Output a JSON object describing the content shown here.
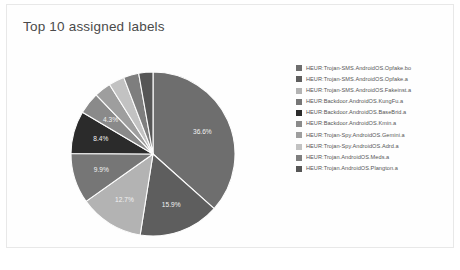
{
  "chart_title": "Top 10 assigned labels",
  "caption": "",
  "chart_data": {
    "type": "pie",
    "title": "Top 10 assigned labels",
    "legend_position": "right",
    "start_angle_deg": 0,
    "direction": "clockwise",
    "categories": [
      "HEUR:Trojan-SMS.AndroidOS.Opfake.bo",
      "HEUR:Trojan-SMS.AndroidOS.Opfake.a",
      "HEUR:Trojan-SMS.AndroidOS.Fakeinst.a",
      "HEUR:Backdoor.AndroidOS.KungFu.a",
      "HEUR:Backdoor.AndroidOS.BaseBrid.a",
      "HEUR:Backdoor.AndroidOS.Kmin.a",
      "HEUR:Trojan-Spy.AndroidOS.Gemini.a",
      "HEUR:Trojan-Spy.AndroidOS.Adrd.a",
      "HEUR:Trojan.AndroidOS.Meds.a",
      "HEUR:Trojan.AndroidOS.Plangton.a"
    ],
    "values": [
      36.6,
      15.9,
      12.7,
      9.9,
      8.4,
      4.3,
      3.3,
      3.1,
      3.0,
      2.8
    ],
    "value_labels": [
      "36.6%",
      "15.9%",
      "12.7%",
      "9.9%",
      "8.4%",
      "4.3%",
      "",
      "",
      "",
      ""
    ],
    "colors": [
      "#6e6e6e",
      "#5e5e5e",
      "#b3b3b3",
      "#767676",
      "#2b2b2b",
      "#8a8a8a",
      "#9e9e9e",
      "#c2c2c2",
      "#7e7e7e",
      "#565656"
    ],
    "units": "percent"
  },
  "legend": {
    "items": [
      {
        "label": "HEUR:Trojan-SMS.AndroidOS.Opfake.bo",
        "color": "#6e6e6e"
      },
      {
        "label": "HEUR:Trojan-SMS.AndroidOS.Opfake.a",
        "color": "#5e5e5e"
      },
      {
        "label": "HEUR:Trojan-SMS.AndroidOS.Fakeinst.a",
        "color": "#b3b3b3"
      },
      {
        "label": "HEUR:Backdoor.AndroidOS.KungFu.a",
        "color": "#767676"
      },
      {
        "label": "HEUR:Backdoor.AndroidOS.BaseBrid.a",
        "color": "#2b2b2b"
      },
      {
        "label": "HEUR:Backdoor.AndroidOS.Kmin.a",
        "color": "#8a8a8a"
      },
      {
        "label": "HEUR:Trojan-Spy.AndroidOS.Gemini.a",
        "color": "#9e9e9e"
      },
      {
        "label": "HEUR:Trojan-Spy.AndroidOS.Adrd.a",
        "color": "#c2c2c2"
      },
      {
        "label": "HEUR:Trojan.AndroidOS.Meds.a",
        "color": "#7e7e7e"
      },
      {
        "label": "HEUR:Trojan.AndroidOS.Plangton.a",
        "color": "#565656"
      }
    ]
  }
}
